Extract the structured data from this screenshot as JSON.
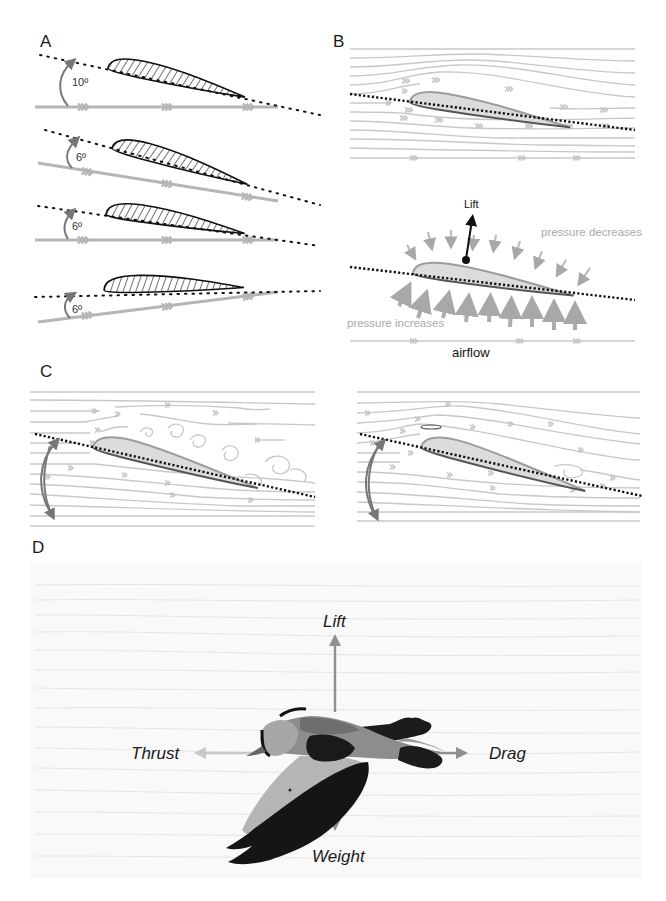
{
  "figure": {
    "panels": {
      "A": {
        "label": "A",
        "angles": [
          "10º",
          "6º",
          "6º",
          "6º"
        ]
      },
      "B": {
        "label": "B",
        "lift_label": "Lift",
        "pressure_decreases": "pressure decreases",
        "pressure_increases": "pressure increases",
        "airflow_label": "airflow"
      },
      "C": {
        "label": "C"
      },
      "D": {
        "label": "D",
        "forces": {
          "lift": "Lift",
          "thrust": "Thrust",
          "drag": "Drag",
          "weight": "Weight"
        }
      }
    },
    "colors": {
      "flow_line": "#c4c4c4",
      "chevron": "#b9b9b9",
      "airfoil_fill": "#dcdcdc",
      "airfoil_top_outline": "#9a9a9a",
      "airfoil_bottom_outline": "#555555",
      "chord_dots": "#1a1a1a",
      "arrow_grey": "#a8a8a8",
      "force_arrow": "#8f8f8f",
      "text_dark": "#1a1a1a"
    }
  }
}
